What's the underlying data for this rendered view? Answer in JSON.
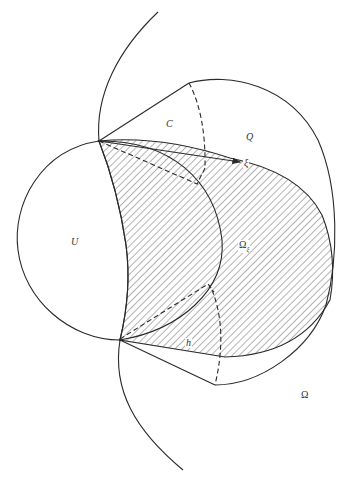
{
  "figure": {
    "labels": {
      "cone": "C",
      "region_q": "Q",
      "ball": "U",
      "omega_xi_main": "Ω",
      "omega_xi_sub": "ξ",
      "xi_vector": "ξ",
      "height": "h",
      "domain": "Ω"
    },
    "colors": {
      "stroke": "#2a2a2a",
      "hatch": "#555555",
      "background": "#ffffff"
    }
  }
}
